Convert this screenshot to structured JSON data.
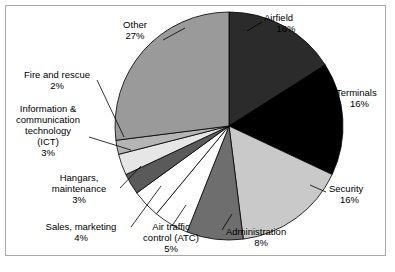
{
  "figure": {
    "border_color": "#a8a8a8",
    "background": "#ffffff"
  },
  "chart_data": {
    "type": "pie",
    "title": "",
    "subtitle": "",
    "xlabel": "",
    "ylabel": "",
    "legend_position": "none",
    "grid": false,
    "start_angle_deg": 0,
    "direction": "clockwise",
    "value_unit": "%",
    "total": 100,
    "categories": [
      "Airfield",
      "Terminals",
      "Security",
      "Administration",
      "Air traffic control (ATC)",
      "Sales, marketing",
      "Hangars, maintenance",
      "Information & communication technology (ICT)",
      "Fire and rescue",
      "Other"
    ],
    "values": [
      16,
      16,
      16,
      8,
      5,
      4,
      3,
      3,
      2,
      27
    ],
    "value_labels": [
      "16%",
      "16%",
      "16%",
      "8%",
      "5%",
      "4%",
      "3%",
      "3%",
      "2%",
      "27%"
    ],
    "colors": [
      "#2b2b2b",
      "#000000",
      "#c9c9c9",
      "#6e6e6e",
      "#ffffff",
      "#ffffff",
      "#5a5a5a",
      "#e6e6e6",
      "#b5b5b5",
      "#9a9a9a"
    ],
    "slice_edge_color": "#000000"
  },
  "labels": {
    "airfield": {
      "lines": [
        "Airfield",
        "16%"
      ]
    },
    "terminals": {
      "lines": [
        "Terminals",
        "16%"
      ]
    },
    "security": {
      "lines": [
        "Security",
        "16%"
      ]
    },
    "administration": {
      "lines": [
        "Administration",
        "8%"
      ]
    },
    "atc": {
      "lines": [
        "Air traffic",
        "control (ATC)",
        "5%"
      ]
    },
    "sales": {
      "lines": [
        "Sales, marketing",
        "4%"
      ]
    },
    "hangars": {
      "lines": [
        "Hangars,",
        "maintenance",
        "3%"
      ]
    },
    "ict": {
      "lines": [
        "Information &",
        "communication",
        "technology",
        "(ICT)",
        "3%"
      ]
    },
    "fire": {
      "lines": [
        "Fire and rescue",
        "2%"
      ]
    },
    "other": {
      "lines": [
        "Other",
        "27%"
      ]
    }
  }
}
